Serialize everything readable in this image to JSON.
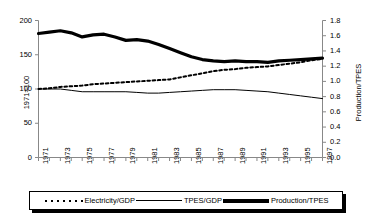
{
  "chart_data": {
    "type": "line",
    "title": "",
    "xlabel": "",
    "ylabel": "1971=100",
    "y2label": "Production/TPES",
    "xlim": [
      1971,
      1997
    ],
    "ylim": [
      0,
      200
    ],
    "y2lim": [
      0.0,
      1.8
    ],
    "grid": false,
    "legend_position": "bottom",
    "x": [
      1971,
      1972,
      1973,
      1974,
      1975,
      1976,
      1977,
      1978,
      1979,
      1980,
      1981,
      1982,
      1983,
      1984,
      1985,
      1986,
      1987,
      1988,
      1989,
      1990,
      1991,
      1992,
      1993,
      1994,
      1995,
      1996,
      1997
    ],
    "yticks": [
      0,
      50,
      100,
      150,
      200
    ],
    "ytick_labels": [
      "0",
      "50",
      "100",
      "150",
      "200"
    ],
    "y2ticks": [
      0.0,
      0.2,
      0.4,
      0.6,
      0.8,
      1.0,
      1.2,
      1.4,
      1.6,
      1.8
    ],
    "y2tick_labels": [
      "0.0",
      "0.2",
      "0.4",
      "0.6",
      "0.8",
      "1.0",
      "1.2",
      "1.4",
      "1.6",
      "1.8"
    ],
    "xtick_labels": [
      "1971",
      "1973",
      "1975",
      "1977",
      "1979",
      "1981",
      "1983",
      "1985",
      "1987",
      "1989",
      "1991",
      "1993",
      "1995",
      "1997"
    ],
    "series": [
      {
        "name": "Electricity/GDP",
        "style": "dotted",
        "axis": "left",
        "values": [
          100,
          101,
          103,
          104,
          105,
          107,
          108,
          109,
          110,
          111,
          112,
          113,
          114,
          117,
          120,
          123,
          126,
          128,
          129,
          131,
          132,
          133,
          135,
          137,
          139,
          142,
          144
        ]
      },
      {
        "name": "TPES/GDP",
        "style": "thin",
        "axis": "left",
        "values": [
          100,
          100,
          100,
          98,
          96,
          96,
          96,
          96,
          96,
          95,
          94,
          94,
          95,
          96,
          97,
          98,
          99,
          99,
          99,
          98,
          97,
          96,
          94,
          92,
          90,
          88,
          86
        ]
      },
      {
        "name": "Production/TPES",
        "style": "thick",
        "axis": "left",
        "values": [
          181,
          183,
          185,
          182,
          176,
          179,
          180,
          176,
          171,
          172,
          170,
          165,
          159,
          153,
          147,
          143,
          141,
          140,
          141,
          140,
          140,
          139,
          141,
          142,
          143,
          144,
          145
        ]
      }
    ]
  },
  "legend": {
    "items": [
      {
        "label": "Electricity/GDP",
        "swatch": "dotted"
      },
      {
        "label": "TPES/GDP",
        "swatch": "thin"
      },
      {
        "label": "Production/TPES",
        "swatch": "thick"
      }
    ]
  }
}
